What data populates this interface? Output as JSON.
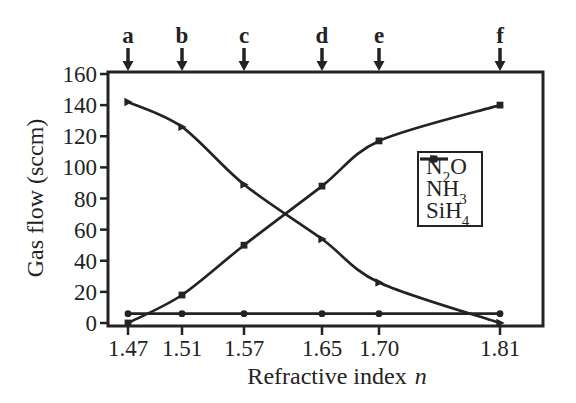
{
  "figure": {
    "background": "#ffffff",
    "ink_color": "#232323"
  },
  "chart_data": {
    "type": "line",
    "title": "",
    "xlabel": "Refractive index",
    "xlabel_italic": "n",
    "ylabel": "Gas flow (sccm)",
    "x_values": [
      1.47,
      1.51,
      1.57,
      1.65,
      1.7,
      1.81
    ],
    "x_tick_labels": [
      "1.47",
      "1.51",
      "1.57",
      "1.65",
      "1.70",
      "1.81"
    ],
    "y_ticks": [
      0,
      20,
      40,
      60,
      80,
      100,
      120,
      140,
      160
    ],
    "ylim": [
      0,
      160
    ],
    "grid": false,
    "legend_position": "upper right",
    "arrow_labels": [
      "a",
      "b",
      "c",
      "d",
      "e",
      "f"
    ],
    "series": [
      {
        "name": "N2O",
        "label_parts": [
          [
            "N",
            false
          ],
          [
            "2",
            true
          ],
          [
            "O",
            false
          ]
        ],
        "marker": "triangle",
        "values": [
          142,
          126,
          89,
          54,
          26,
          0
        ]
      },
      {
        "name": "NH3",
        "label_parts": [
          [
            "NH",
            false
          ],
          [
            "3",
            true
          ]
        ],
        "marker": "square",
        "values": [
          0,
          18,
          50,
          88,
          117,
          140
        ]
      },
      {
        "name": "SiH4",
        "label_parts": [
          [
            "SiH",
            false
          ],
          [
            "4",
            true
          ]
        ],
        "marker": "circle",
        "values": [
          6,
          6,
          6,
          6,
          6,
          6
        ]
      }
    ]
  }
}
